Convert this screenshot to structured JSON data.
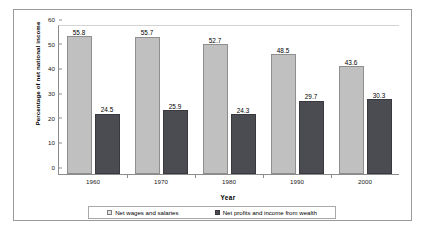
{
  "chart_data": {
    "type": "bar",
    "title": "",
    "xlabel": "Year",
    "ylabel": "Percentage of net national income",
    "categories": [
      "1960",
      "1970",
      "1980",
      "1990",
      "2000"
    ],
    "series": [
      {
        "name": "Net wages and salaries",
        "color": "#c0c0c0",
        "values": [
          55.8,
          55.7,
          52.7,
          48.5,
          43.6
        ]
      },
      {
        "name": "Net profits and income from wealth",
        "color": "#4b4b52",
        "values": [
          24.5,
          25.9,
          24.3,
          29.7,
          30.3
        ]
      }
    ],
    "ylim": [
      0,
      60
    ],
    "yticks": [
      60,
      50,
      40,
      30,
      20,
      10,
      0
    ],
    "grid": false,
    "legend_position": "bottom",
    "data_labels": true
  }
}
